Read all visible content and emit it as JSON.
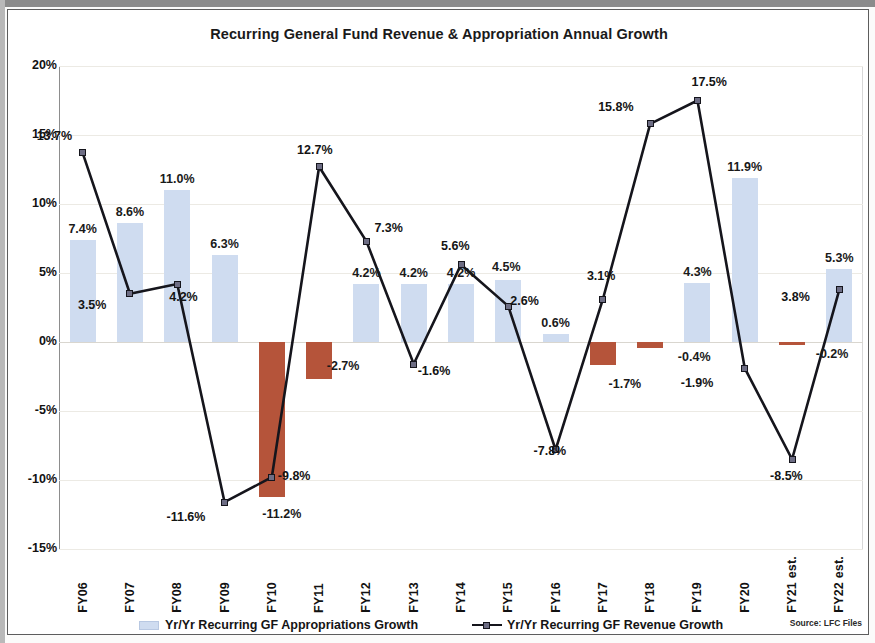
{
  "chart_data": {
    "type": "bar",
    "title": "Recurring General Fund Revenue & Appropriation Annual Growth",
    "xlabel": "",
    "ylabel": "",
    "ylim": [
      -15,
      20
    ],
    "ytick_labels": [
      "20%",
      "15%",
      "10%",
      "5%",
      "0%",
      "-5%",
      "-10%",
      "-15%"
    ],
    "ytick_values": [
      20,
      15,
      10,
      5,
      0,
      -5,
      -10,
      -15
    ],
    "grid": true,
    "legend_position": "bottom",
    "categories": [
      "FY06",
      "FY07",
      "FY08",
      "FY09",
      "FY10",
      "FY11",
      "FY12",
      "FY13",
      "FY14",
      "FY15",
      "FY16",
      "FY17",
      "FY18",
      "FY19",
      "FY20",
      "FY21 est.",
      "FY22 est."
    ],
    "series": [
      {
        "name": "Yr/Yr Recurring GF Appropriations Growth",
        "type": "bar",
        "color": "#cfdcf0",
        "negative_color": "#b5543a",
        "values": [
          7.4,
          8.6,
          11.0,
          6.3,
          -11.2,
          -2.7,
          4.2,
          4.2,
          4.2,
          4.5,
          0.6,
          -1.7,
          -0.4,
          4.3,
          11.9,
          -0.2,
          5.3
        ],
        "labels": [
          "7.4%",
          "8.6%",
          "11.0%",
          "6.3%",
          "-11.2%",
          "-2.7%",
          "4.2%",
          "4.2%",
          "4.2%",
          "4.5%",
          "0.6%",
          "-1.7%",
          "-0.4%",
          "4.3%",
          "11.9%",
          "-0.2%",
          "5.3%"
        ]
      },
      {
        "name": "Yr/Yr Recurring GF Revenue Growth",
        "type": "line",
        "color": "#15151c",
        "marker_color": "#6d6d84",
        "values": [
          13.7,
          3.5,
          4.2,
          -11.6,
          -9.8,
          12.7,
          7.3,
          -1.6,
          5.6,
          2.6,
          -7.8,
          3.1,
          15.8,
          17.5,
          -1.9,
          -8.5,
          3.8
        ],
        "labels": [
          "13.7%",
          "3.5%",
          "4.2%",
          "-11.6%",
          "-9.8%",
          "12.7%",
          "7.3%",
          "-1.6%",
          "5.6%",
          "2.6%",
          "-7.8%",
          "3.1%",
          "15.8%",
          "17.5%",
          "-1.9%",
          "-8.5%",
          "3.8%"
        ]
      }
    ],
    "source_note": "Source: LFC Files"
  },
  "legend": {
    "bars_label": "Yr/Yr Recurring GF Appropriations Growth",
    "line_label": "Yr/Yr Recurring GF Revenue Growth"
  }
}
